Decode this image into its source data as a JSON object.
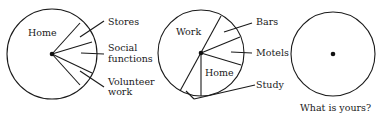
{
  "diagrams": [
    {
      "name": "pie-1",
      "center_label": "Home",
      "callouts": [
        "Stores",
        "Social",
        "functions",
        "Volunteer",
        "work"
      ]
    },
    {
      "name": "pie-2",
      "labels": [
        "Work",
        "Home"
      ],
      "callouts": [
        "Bars",
        "Motels",
        "Study"
      ]
    },
    {
      "name": "pie-3",
      "caption": "What is yours?"
    }
  ]
}
